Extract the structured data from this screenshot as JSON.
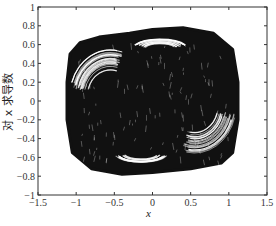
{
  "chart_data": {
    "type": "scatter",
    "subtype": "phase-portrait",
    "title": "",
    "xlabel": "x",
    "ylabel": "对 x 求导数",
    "xlim": [
      -1.5,
      1.5
    ],
    "ylim": [
      -1,
      1
    ],
    "xticks": [
      "-1.5",
      "-1",
      "-0.5",
      "0",
      "0.5",
      "1",
      "1.5"
    ],
    "yticks": [
      "1",
      "0.8",
      "0.6",
      "0.4",
      "0.2",
      "0",
      "-0.2",
      "-0.4",
      "-0.6",
      "-0.8",
      "-1"
    ],
    "grid": false,
    "legend": null,
    "series": [
      {
        "name": "trajectory",
        "color": "#111111",
        "description": "Dense chaotic trajectory filling a rounded rectangular region with white loop streaks",
        "region_bounds": {
          "x": [
            -1.15,
            1.15
          ],
          "y": [
            -0.82,
            0.82
          ]
        },
        "outline": [
          [
            -0.95,
            0.62
          ],
          [
            -0.7,
            0.68
          ],
          [
            -0.3,
            0.72
          ],
          [
            0.0,
            0.76
          ],
          [
            0.4,
            0.78
          ],
          [
            0.8,
            0.72
          ],
          [
            1.05,
            0.55
          ],
          [
            1.12,
            0.2
          ],
          [
            1.12,
            -0.2
          ],
          [
            1.05,
            -0.55
          ],
          [
            0.9,
            -0.66
          ],
          [
            0.5,
            -0.72
          ],
          [
            0.0,
            -0.76
          ],
          [
            -0.4,
            -0.78
          ],
          [
            -0.8,
            -0.72
          ],
          [
            -1.05,
            -0.55
          ],
          [
            -1.12,
            -0.2
          ],
          [
            -1.12,
            0.2
          ],
          [
            -1.08,
            0.5
          ]
        ]
      }
    ]
  },
  "axes": {
    "xlabel": "x",
    "ylabel": "对 x 求导数"
  }
}
